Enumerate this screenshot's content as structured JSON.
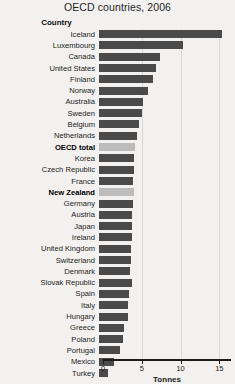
{
  "chart_data": {
    "type": "bar",
    "orientation": "horizontal",
    "title": "OECD countries, 2006",
    "xlabel": "Tonnes",
    "ylabel": "Country",
    "xlim": [
      0,
      16.5
    ],
    "xticks": [
      0,
      5,
      10,
      15
    ],
    "xtick_labels": [
      "0",
      "5",
      "10",
      "15"
    ],
    "grid": true,
    "grid_axis": "x",
    "legend": null,
    "categories": [
      "Iceland",
      "Luxembourg",
      "Canada",
      "United States",
      "Finland",
      "Norway",
      "Australia",
      "Sweden",
      "Belgium",
      "Netherlands",
      "OECD total",
      "Korea",
      "Czech Republic",
      "France",
      "New Zealand",
      "Germany",
      "Austria",
      "Japan",
      "Ireland",
      "United Kingdom",
      "Switzerland",
      "Denmark",
      "Slovak Republic",
      "Spain",
      "Italy",
      "Hungary",
      "Greece",
      "Poland",
      "Portugal",
      "Mexico",
      "Turkey"
    ],
    "values": [
      15.9,
      10.8,
      7.9,
      7.3,
      7.0,
      6.3,
      5.7,
      5.5,
      5.1,
      4.9,
      4.7,
      4.5,
      4.5,
      4.4,
      4.5,
      4.4,
      4.3,
      4.2,
      4.2,
      4.1,
      4.1,
      4.0,
      4.3,
      3.9,
      3.8,
      3.7,
      3.2,
      3.1,
      2.7,
      1.9,
      1.1
    ],
    "highlighted": [
      "OECD total",
      "New Zealand"
    ],
    "colors": {
      "bar": "#4a4a4a",
      "bar_highlight": "#bcbcbc",
      "background": "#f2f1ef",
      "axis": "#1b1b1b",
      "grid": "#d9d8d5",
      "text": "#1b1b1b"
    }
  }
}
